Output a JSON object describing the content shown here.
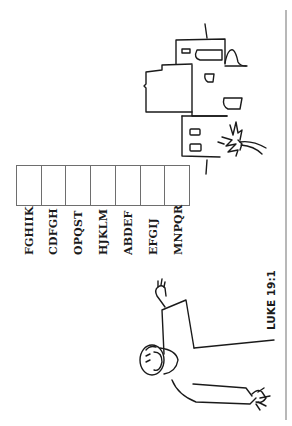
{
  "worksheet": {
    "answer_box_count": 7,
    "clues": [
      {
        "letters": "FGHIIK"
      },
      {
        "letters": "CDFGH"
      },
      {
        "letters": "OPQST"
      },
      {
        "letters": "HJKLM"
      },
      {
        "letters": "ABDEF"
      },
      {
        "letters": "EFGIJ"
      },
      {
        "letters": "MNPQR"
      }
    ],
    "reference": "LUKE 19:1"
  },
  "illustrations": {
    "buildings": "town-buildings-with-palm-tree",
    "figure": "man-waving-arms"
  },
  "colors": {
    "ink": "#1a1a1a",
    "box_border": "#6e6e6e",
    "page_border": "#b8b8b8",
    "background": "#ffffff"
  }
}
